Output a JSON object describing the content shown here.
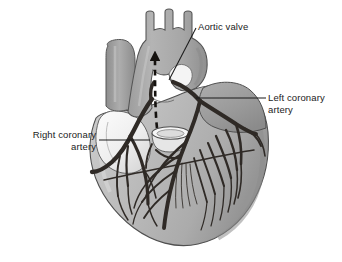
{
  "figure": {
    "type": "anatomical-illustration",
    "background_color": "#ffffff",
    "width": 342,
    "height": 262
  },
  "labels": {
    "aortic_valve": {
      "text": "Aortic valve",
      "name": "aortic-valve-label"
    },
    "left_coronary_artery": {
      "text": "Left coronary\nartery",
      "name": "left-coronary-artery-label"
    },
    "right_coronary_artery": {
      "text": "Right coronary\nartery",
      "name": "right-coronary-artery-label"
    }
  },
  "colors": {
    "text": "#1b1b1b",
    "leader_line": "#1b1b1b",
    "vessel_dark": "#2f2a26",
    "aorta_fill": "#a9a9a9",
    "aorta_stroke": "#5a5a5a",
    "vena_cava_fill": "#a0a0a0",
    "atrium_pale": "#f2f2f2",
    "ventricle_fill": "#b8b8b8",
    "ventricle_shadow": "#9a9a9a",
    "right_chamber_fill": "#9d9d9d",
    "outline": "#4a4a4a",
    "background": "#ffffff",
    "flow_arrow": "#15120f"
  },
  "annotations": {
    "flow_arrow": {
      "name": "blood-flow-arrow",
      "style": "dashed-upward-arrow",
      "meaning": "direction of blood flow through the aorta"
    },
    "leader_lines": [
      "aortic-valve-leader",
      "left-coronary-leader",
      "right-coronary-leader"
    ]
  },
  "structures": [
    {
      "name": "aorta",
      "shade": "#a9a9a9"
    },
    {
      "name": "aortic-arch-branches",
      "shade": "#a9a9a9"
    },
    {
      "name": "superior-vena-cava",
      "shade": "#a0a0a0"
    },
    {
      "name": "right-atrial-appendage",
      "shade": "#f2f2f2"
    },
    {
      "name": "pulmonary-trunk-stump",
      "shade": "#ededed"
    },
    {
      "name": "left-ventricle",
      "shade": "#b8b8b8"
    },
    {
      "name": "right-ventricle",
      "shade": "#b0b0b0"
    },
    {
      "name": "left-atrium",
      "shade": "#9d9d9d"
    },
    {
      "name": "coronary-artery-network",
      "shade": "#2f2a26"
    }
  ]
}
